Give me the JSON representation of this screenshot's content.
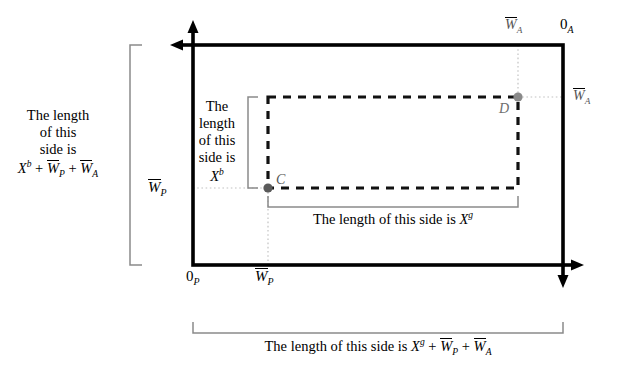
{
  "figure": {
    "type": "edgeworth-box-diagram",
    "background": "#ffffff",
    "outer_box": {
      "corner_origin_bottom_left": "0_P",
      "corner_origin_top_right": "0_A",
      "stroke_color": "#000000"
    },
    "labels": {
      "origin_p": "0",
      "origin_p_sub": "P",
      "origin_a": "0",
      "origin_a_sub": "A",
      "w_bar_p_left": "W",
      "w_bar_p_left_sub": "P",
      "w_bar_p_bottom": "W",
      "w_bar_p_bottom_sub": "P",
      "w_bar_a_top": "W",
      "w_bar_a_top_sub": "A",
      "w_bar_a_right": "W",
      "w_bar_a_right_sub": "A",
      "point_c": "C",
      "point_d": "D"
    },
    "captions": {
      "left_vertical": {
        "line1": "The length",
        "line2": "of this",
        "line3": "side is",
        "formula": "X^b + W̄_P + W̄_A",
        "formula_parts": {
          "x": "X",
          "x_sup": "b",
          "plus1": "+",
          "w1": "W",
          "w1_sub": "P",
          "plus2": "+",
          "w2": "W",
          "w2_sub": "A"
        }
      },
      "inner_vertical": {
        "line1": "The",
        "line2": "length",
        "line3": "of this",
        "line4": "side is",
        "formula": "X^b",
        "formula_parts": {
          "x": "X",
          "x_sup": "b"
        }
      },
      "inner_horizontal": {
        "text": "The length of this side is",
        "formula": "X^g",
        "formula_parts": {
          "x": "X",
          "x_sup": "g"
        }
      },
      "bottom": {
        "text": "The length of this side is",
        "formula": "X^g + W̄_P + W̄_A",
        "formula_parts": {
          "x": "X",
          "x_sup": "g",
          "plus1": "+",
          "w1": "W",
          "w1_sub": "P",
          "plus2": "+",
          "w2": "W",
          "w2_sub": "A"
        }
      }
    },
    "colors": {
      "axis": "#000000",
      "dashed_rect": "#111111",
      "guide_dotted": "#b9b9b9",
      "bracket": "#8a8a8a",
      "point_fill": "#707070",
      "point_c_fill": "#5a5a5a"
    }
  }
}
